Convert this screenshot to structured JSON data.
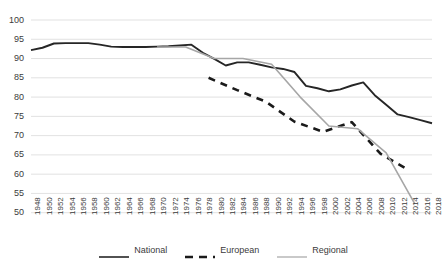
{
  "chart_data": {
    "type": "line",
    "title": "",
    "subtitle": "",
    "xlabel": "",
    "ylabel": "",
    "ylim": [
      50,
      100
    ],
    "ytick_step": 5,
    "yticks": [
      50,
      55,
      60,
      65,
      70,
      75,
      80,
      85,
      90,
      95,
      100
    ],
    "xlim": [
      1948,
      2018
    ],
    "xtick_step": 2,
    "xticks": [
      1948,
      1950,
      1952,
      1954,
      1956,
      1958,
      1960,
      1962,
      1964,
      1966,
      1968,
      1970,
      1972,
      1974,
      1976,
      1978,
      1980,
      1982,
      1984,
      1986,
      1988,
      1990,
      1992,
      1994,
      1996,
      1998,
      2000,
      2002,
      2004,
      2006,
      2008,
      2010,
      2012,
      2014,
      2016,
      2018
    ],
    "grid": "horizontal",
    "legend_position": "bottom",
    "series": [
      {
        "name": "National",
        "color": "#262626",
        "style": "solid",
        "x": [
          1948,
          1950,
          1952,
          1954,
          1956,
          1958,
          1960,
          1962,
          1964,
          1966,
          1968,
          1970,
          1972,
          1974,
          1976,
          1978,
          1980,
          1982,
          1984,
          1986,
          1988,
          1990,
          1992,
          1994,
          1996,
          1998,
          2000,
          2002,
          2004,
          2006,
          2008,
          2010,
          2012,
          2014,
          2016,
          2018
        ],
        "values": [
          92.2,
          92.8,
          93.9,
          94.0,
          94.0,
          94.0,
          93.6,
          93.1,
          93.0,
          93.0,
          93.0,
          93.1,
          93.2,
          93.4,
          93.6,
          91.5,
          89.9,
          88.2,
          89.0,
          89.0,
          88.4,
          87.7,
          87.3,
          86.5,
          82.9,
          82.3,
          81.5,
          82.0,
          83.0,
          83.8,
          80.5,
          78.0,
          75.5,
          74.8,
          74.0,
          73.2
        ]
      },
      {
        "name": "European",
        "color": "#1a1a1a",
        "style": "dashed",
        "x": [
          1979,
          1984,
          1989,
          1994,
          1999,
          2004,
          2009,
          2014
        ],
        "values": [
          85.0,
          81.8,
          78.8,
          73.6,
          71.0,
          73.5,
          65.3,
          61.0
        ]
      },
      {
        "name": "Regional",
        "color": "#a6a6a6",
        "style": "solid",
        "x": [
          1970,
          1975,
          1980,
          1985,
          1990,
          1995,
          2000,
          2005,
          2010,
          2015
        ],
        "values": [
          93.0,
          93.0,
          90.0,
          90.0,
          88.5,
          80.0,
          72.5,
          71.8,
          65.5,
          52.3
        ]
      }
    ]
  },
  "legend": {
    "items": [
      {
        "label": "National",
        "style": "solid",
        "color": "#262626"
      },
      {
        "label": "European",
        "style": "dashed",
        "color": "#1a1a1a"
      },
      {
        "label": "Regional",
        "style": "solid",
        "color": "#a6a6a6"
      }
    ]
  }
}
